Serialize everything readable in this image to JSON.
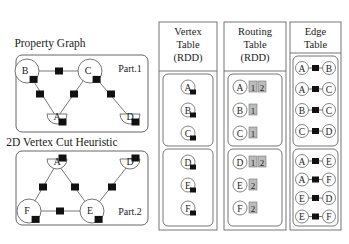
{
  "graph_top": {
    "title": "Property Graph",
    "part_label": "Part.1",
    "vertices": [
      {
        "id": "B",
        "x": 27,
        "y": 71,
        "r": 12,
        "shape": "circle"
      },
      {
        "id": "C",
        "x": 90,
        "y": 71,
        "r": 12,
        "shape": "circle"
      },
      {
        "id": "A",
        "x": 57,
        "y": 118,
        "r": 10,
        "shape": "half"
      },
      {
        "id": "D",
        "x": 130,
        "y": 118,
        "r": 10,
        "shape": "half"
      }
    ],
    "edges": [
      {
        "from": "B",
        "to": "C",
        "mid": [
          59,
          71
        ]
      },
      {
        "from": "B",
        "to": "A",
        "mid": [
          40,
          94
        ]
      },
      {
        "from": "C",
        "to": "A",
        "mid": [
          74,
          94
        ]
      },
      {
        "from": "C",
        "to": "D",
        "mid": [
          111,
          94
        ]
      }
    ]
  },
  "graph_bottom": {
    "title": "2D Vertex Cut Heuristic",
    "part_label": "Part.2",
    "vertices": [
      {
        "id": "A",
        "x": 57,
        "y": 163,
        "r": 10,
        "shape": "half"
      },
      {
        "id": "D",
        "x": 130,
        "y": 163,
        "r": 10,
        "shape": "half"
      },
      {
        "id": "F",
        "x": 29,
        "y": 211,
        "r": 12,
        "shape": "circle"
      },
      {
        "id": "E",
        "x": 92,
        "y": 211,
        "r": 12,
        "shape": "circle"
      }
    ],
    "edges": [
      {
        "from": "A",
        "to": "F",
        "mid": [
          43,
          187
        ]
      },
      {
        "from": "A",
        "to": "E",
        "mid": [
          75,
          187
        ]
      },
      {
        "from": "D",
        "to": "E",
        "mid": [
          112,
          187
        ]
      },
      {
        "from": "F",
        "to": "E",
        "mid": [
          60,
          211
        ]
      }
    ]
  },
  "vertex_table": {
    "title_lines": [
      "Vertex",
      "Table",
      "(RDD)"
    ],
    "partitions": [
      [
        "A",
        "B",
        "C"
      ],
      [
        "D",
        "E",
        "F"
      ]
    ]
  },
  "routing_table": {
    "title_lines": [
      "Routing",
      "Table",
      "(RDD)"
    ],
    "partitions": [
      [
        {
          "v": "A",
          "parts": [
            "1",
            "2"
          ]
        },
        {
          "v": "B",
          "parts": [
            "1"
          ]
        },
        {
          "v": "C",
          "parts": [
            "1"
          ]
        }
      ],
      [
        {
          "v": "D",
          "parts": [
            "1",
            "2"
          ]
        },
        {
          "v": "E",
          "parts": [
            "2"
          ]
        },
        {
          "v": "F",
          "parts": [
            "2"
          ]
        }
      ]
    ]
  },
  "edge_table": {
    "title_lines": [
      "Edge",
      "Table"
    ],
    "partitions": [
      [
        [
          "A",
          "B"
        ],
        [
          "A",
          "C"
        ],
        [
          "B",
          "C"
        ],
        [
          "C",
          "D"
        ]
      ],
      [
        [
          "A",
          "E"
        ],
        [
          "A",
          "F"
        ],
        [
          "E",
          "D"
        ],
        [
          "E",
          "F"
        ]
      ]
    ]
  },
  "colors": {
    "stroke": "#666666",
    "edge_box": "#111111",
    "partition_box_fill": "#bbbbbb"
  }
}
